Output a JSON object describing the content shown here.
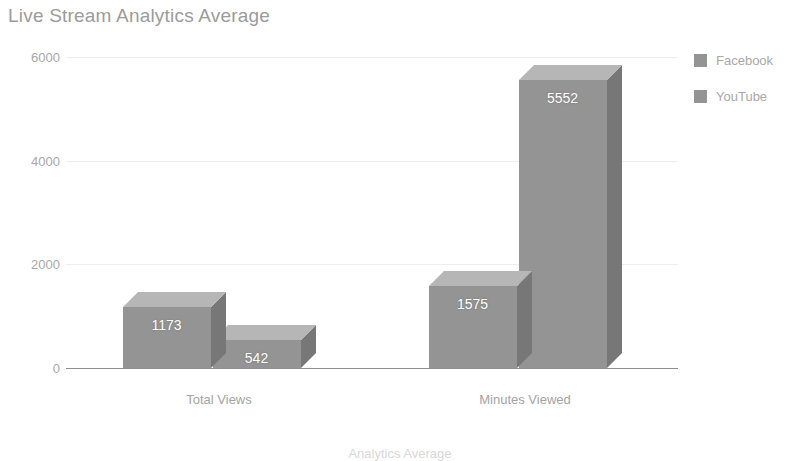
{
  "chart_data": {
    "type": "bar",
    "title": "Live Stream Analytics Average",
    "subtitle": "",
    "xlabel": "Analytics Average",
    "ylabel": "",
    "categories": [
      "Total Views",
      "Minutes Viewed"
    ],
    "series": [
      {
        "name": "Facebook",
        "values": [
          1173,
          1575
        ],
        "color": "#949494"
      },
      {
        "name": "YouTube",
        "values": [
          542,
          5552
        ],
        "color": "#949494"
      }
    ],
    "ylim": [
      0,
      6000
    ],
    "yticks": [
      0,
      2000,
      4000,
      6000
    ],
    "ytick_labels": [
      "0",
      "2000",
      "4000",
      "6000"
    ],
    "grid": true,
    "legend_position": "right",
    "style": "3d-bar",
    "data_labels": [
      {
        "series": "Facebook",
        "category": "Total Views",
        "label": "1173"
      },
      {
        "series": "YouTube",
        "category": "Total Views",
        "label": "542"
      },
      {
        "series": "Facebook",
        "category": "Minutes Viewed",
        "label": "1575"
      },
      {
        "series": "YouTube",
        "category": "Minutes Viewed",
        "label": "5552"
      }
    ],
    "colors": {
      "bar_front": "#949494",
      "bar_top": "#b6b6b6",
      "bar_side": "#777777",
      "gridline": "#ededed",
      "axis_line": "#8f8f8f",
      "title_text": "#9b9b9b",
      "tick_text": "#a8a8a8",
      "value_text": "#ffffff",
      "background": "#ffffff"
    }
  }
}
